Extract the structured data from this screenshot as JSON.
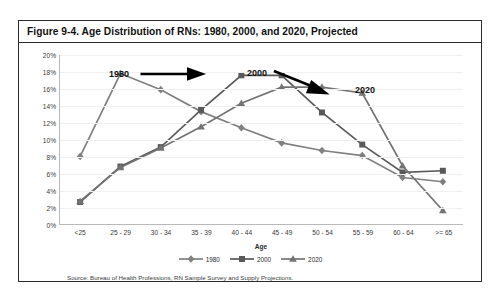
{
  "figure": {
    "title": "Figure 9-4. Age Distribution of RNs: 1980, 2000, and 2020, Projected",
    "source": "Source: Bureau of Health Professions, RN Sample Survey and Supply Projections."
  },
  "annotations": [
    {
      "id": "anno-1980",
      "label": "1980"
    },
    {
      "id": "anno-2000",
      "label": "2000"
    },
    {
      "id": "anno-2020",
      "label": "2020"
    }
  ],
  "colors": {
    "series_1980": "#808080",
    "series_2000": "#595959",
    "series_2020": "#737373",
    "gridline": "#efefef",
    "axis": "#b9b9b9",
    "frame": "#2b2b2b",
    "arrow": "#000000"
  },
  "chart_data": {
    "type": "line",
    "title": "Figure 9-4. Age Distribution of RNs: 1980, 2000, and 2020, Projected",
    "xlabel": "Age",
    "ylabel": "",
    "ylim": [
      0,
      20
    ],
    "ytick_labels": [
      "0%",
      "2%",
      "4%",
      "6%",
      "8%",
      "10%",
      "12%",
      "14%",
      "16%",
      "18%",
      "20%"
    ],
    "ytick_values": [
      0,
      2,
      4,
      6,
      8,
      10,
      12,
      14,
      16,
      18,
      20
    ],
    "grid": true,
    "legend_position": "bottom",
    "categories": [
      "<25",
      "25 - 29",
      "30 - 34",
      "35 - 39",
      "40 - 44",
      "45 - 49",
      "50 - 54",
      "55 - 59",
      "60 - 64",
      ">= 65"
    ],
    "series": [
      {
        "name": "1980",
        "marker": "diamond",
        "color": "#808080",
        "values": [
          8.0,
          17.8,
          15.9,
          13.3,
          11.4,
          9.6,
          8.7,
          8.1,
          5.5,
          5.0
        ]
      },
      {
        "name": "2000",
        "marker": "square",
        "color": "#595959",
        "values": [
          2.6,
          6.8,
          9.1,
          13.5,
          17.6,
          17.6,
          13.2,
          9.4,
          6.1,
          6.3
        ]
      },
      {
        "name": "2020",
        "marker": "triangle",
        "color": "#737373",
        "values": [
          2.7,
          6.7,
          9.0,
          11.5,
          14.3,
          16.2,
          16.2,
          15.5,
          6.9,
          1.6
        ]
      }
    ]
  }
}
